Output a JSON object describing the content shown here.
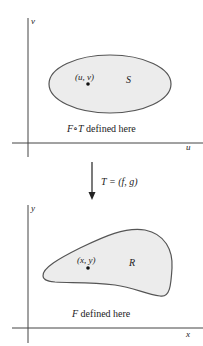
{
  "top_panel": {
    "axes": {
      "horizontal_label": "u",
      "vertical_label": "v"
    },
    "region_label": "S",
    "point_label": "(u, v)",
    "caption_func": "F∘T",
    "caption_rest": " defined here"
  },
  "mapping": {
    "label_lhs": "T",
    "label_rhs": " = (f, g)"
  },
  "bottom_panel": {
    "axes": {
      "horizontal_label": "x",
      "vertical_label": "y"
    },
    "region_label": "R",
    "point_label": "(x, y)",
    "caption_func": "F",
    "caption_rest": " defined here"
  },
  "colors": {
    "region_fill": "#ececec",
    "outline": "#555555",
    "axis": "#444444"
  }
}
